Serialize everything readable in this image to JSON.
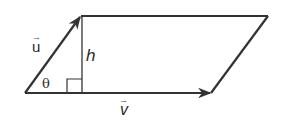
{
  "diagram": {
    "type": "parallelogram-area",
    "stroke_color": "#333333",
    "vertices": {
      "bottom_left": [
        25,
        93
      ],
      "top_left": [
        81,
        16
      ],
      "top_right": [
        268,
        16
      ],
      "bottom_right": [
        211,
        93
      ]
    },
    "labels": {
      "u_vector": "u",
      "v_vector": "v",
      "height": "h",
      "angle": "θ"
    },
    "vector_arrow": "→"
  }
}
